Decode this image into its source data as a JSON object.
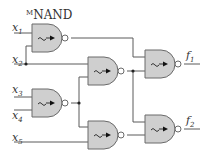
{
  "diagram": {
    "title_prefix": "M",
    "title": "NAND",
    "gate_type": "NAND",
    "gate_icon": "memristor-nand-icon",
    "inputs": [
      {
        "name": "x",
        "sub": "1"
      },
      {
        "name": "x",
        "sub": "2"
      },
      {
        "name": "x",
        "sub": "3"
      },
      {
        "name": "x",
        "sub": "4"
      },
      {
        "name": "x",
        "sub": "5"
      }
    ],
    "outputs": [
      {
        "name": "f",
        "sub": "1"
      },
      {
        "name": "f",
        "sub": "2"
      }
    ],
    "gates": [
      {
        "id": "G1",
        "inputs": [
          "x1",
          "x2"
        ],
        "output": "to G5"
      },
      {
        "id": "G2",
        "inputs": [
          "x2",
          "G3"
        ],
        "output": "to G5, G6"
      },
      {
        "id": "G3",
        "inputs": [
          "x3",
          "x4"
        ],
        "output": "to G2, G4"
      },
      {
        "id": "G4",
        "inputs": [
          "G3",
          "x5"
        ],
        "output": "to G6"
      },
      {
        "id": "G5",
        "inputs": [
          "G1",
          "G2"
        ],
        "output": "f1"
      },
      {
        "id": "G6",
        "inputs": [
          "G2",
          "G4"
        ],
        "output": "f2"
      }
    ],
    "colors": {
      "gate_fill": "#cfcfcf",
      "gate_stroke": "#6a6a6a",
      "wire": "#5a5a5a",
      "node": "#222222"
    }
  }
}
